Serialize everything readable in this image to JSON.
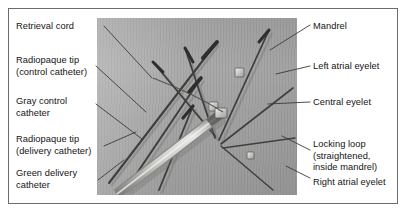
{
  "figure": {
    "photo_caption": "grayscale photograph of septal occluder delivery system",
    "background_color": "#a9a9a9",
    "border_color": "#6b6b6b",
    "leader_color": "#3a3a3a",
    "text_color": "#141414"
  },
  "labels_left": [
    {
      "id": "retrieval-cord",
      "text": "Retrieval cord",
      "x": 16,
      "y": 21
    },
    {
      "id": "radiopaque-tip-control",
      "text": "Radiopaque tip\n(control catheter)",
      "x": 16,
      "y": 55
    },
    {
      "id": "gray-control-catheter",
      "text": "Gray control\ncatheter",
      "x": 16,
      "y": 96
    },
    {
      "id": "radiopaque-tip-delivery",
      "text": "Radiopaque tip\n(delivery catheter)",
      "x": 16,
      "y": 134
    },
    {
      "id": "green-delivery-catheter",
      "text": "Green delivery\ncatheter",
      "x": 16,
      "y": 168
    }
  ],
  "labels_right": [
    {
      "id": "mandrel",
      "text": "Mandrel",
      "x": 313,
      "y": 21
    },
    {
      "id": "left-atrial-eyelet",
      "text": "Left atrial eyelet",
      "x": 313,
      "y": 61
    },
    {
      "id": "central-eyelet",
      "text": "Central eyelet",
      "x": 313,
      "y": 97
    },
    {
      "id": "locking-loop",
      "text": "Locking loop\n(straightened,\ninside mandrel)",
      "x": 313,
      "y": 139
    },
    {
      "id": "right-atrial-eyelet",
      "text": "Right atrial eyelet",
      "x": 313,
      "y": 177
    }
  ],
  "leaders": [
    {
      "id": "leader-retrieval-cord",
      "x1": 104,
      "y1": 26,
      "x2": 152,
      "y2": 78
    },
    {
      "id": "leader-radiopaque-tip-control",
      "x1": 96,
      "y1": 66,
      "x2": 146,
      "y2": 112
    },
    {
      "id": "leader-gray-control-catheter",
      "x1": 96,
      "y1": 104,
      "x2": 142,
      "y2": 139
    },
    {
      "id": "leader-radiopaque-tip-delivery",
      "x1": 104,
      "y1": 146,
      "x2": 136,
      "y2": 132
    },
    {
      "id": "leader-green-delivery-catheter",
      "x1": 98,
      "y1": 180,
      "x2": 124,
      "y2": 160
    },
    {
      "id": "leader-mandrel",
      "x1": 310,
      "y1": 25,
      "x2": 270,
      "y2": 50
    },
    {
      "id": "leader-left-atrial-eyelet",
      "x1": 310,
      "y1": 66,
      "x2": 276,
      "y2": 74
    },
    {
      "id": "leader-central-eyelet",
      "x1": 310,
      "y1": 102,
      "x2": 268,
      "y2": 104
    },
    {
      "id": "leader-locking-loop",
      "x1": 310,
      "y1": 150,
      "x2": 282,
      "y2": 136
    },
    {
      "id": "leader-right-atrial-eyelet",
      "x1": 310,
      "y1": 178,
      "x2": 286,
      "y2": 166
    }
  ],
  "photo_features": {
    "mandrel_wires": [
      {
        "id": "wire-1",
        "x1": 12,
        "y1": 165,
        "x2": 120,
        "y2": 24
      },
      {
        "id": "wire-2",
        "x1": 30,
        "y1": 170,
        "x2": 104,
        "y2": 60
      },
      {
        "id": "wire-3",
        "x1": 62,
        "y1": 172,
        "x2": 96,
        "y2": 88
      },
      {
        "id": "wire-4",
        "x1": 118,
        "y1": 118,
        "x2": 56,
        "y2": 44
      },
      {
        "id": "wire-5",
        "x1": 118,
        "y1": 120,
        "x2": 88,
        "y2": 30
      },
      {
        "id": "wire-6",
        "x1": 122,
        "y1": 122,
        "x2": 172,
        "y2": 12
      }
    ],
    "eyelets": [
      {
        "id": "eyelet-left-atrial",
        "x": 138,
        "y": 50,
        "w": 9,
        "h": 9
      },
      {
        "id": "eyelet-central",
        "x": 112,
        "y": 84,
        "w": 9,
        "h": 9
      },
      {
        "id": "eyelet-right-atrial",
        "x": 150,
        "y": 134,
        "w": 7,
        "h": 7
      }
    ],
    "catheter": {
      "id": "delivery-catheter-shaft",
      "x1": 20,
      "y1": 176,
      "x2": 124,
      "y2": 96,
      "body_color": "#d8d8d4",
      "edge_color": "#8b8b88"
    }
  }
}
